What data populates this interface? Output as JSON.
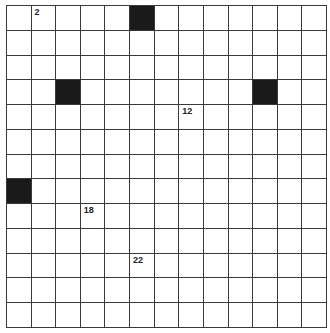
{
  "puzzle": {
    "rows": 13,
    "cols": 13,
    "black_cells": [
      [
        0,
        5
      ],
      [
        3,
        2
      ],
      [
        3,
        10
      ],
      [
        7,
        0
      ]
    ],
    "numbers": [
      {
        "row": 0,
        "col": 1,
        "label": "2"
      },
      {
        "row": 4,
        "col": 7,
        "label": "12"
      },
      {
        "row": 8,
        "col": 3,
        "label": "18"
      },
      {
        "row": 10,
        "col": 5,
        "label": "22"
      }
    ]
  }
}
